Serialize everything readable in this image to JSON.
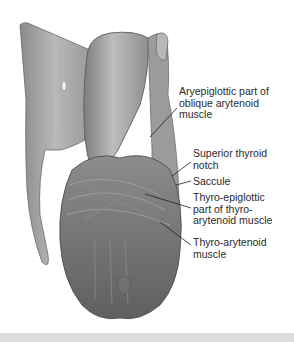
{
  "figure": {
    "labels": [
      {
        "id": "aryepiglottic",
        "text": "Aryepiglottic part of\noblique arytenoid\nmuscle",
        "x": 179,
        "y": 86
      },
      {
        "id": "superior-thyroid-notch",
        "text": "Superior thyroid\nnotch",
        "x": 193,
        "y": 148
      },
      {
        "id": "saccule",
        "text": "Saccule",
        "x": 193,
        "y": 176
      },
      {
        "id": "thyro-epiglottic",
        "text": "Thyro-epiglottic\npart of thyro-\narytenoid muscle",
        "x": 193,
        "y": 192
      },
      {
        "id": "thyro-arytenoid",
        "text": "Thyro-arytenoid\nmuscle",
        "x": 193,
        "y": 237
      }
    ]
  },
  "colors": {
    "background": "#ffffff",
    "tissue_dark": "#6e6e6e",
    "tissue_mid": "#9a9a9a",
    "tissue_light": "#c8c8c8",
    "leader_line": "#1e1e1e",
    "label_text": "#2a2a2a",
    "bottom_bar": "#dcdcdc"
  }
}
